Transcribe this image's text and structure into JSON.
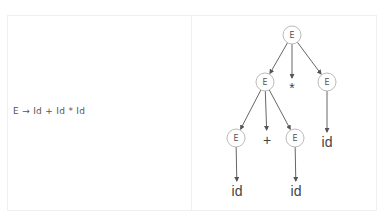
{
  "production": {
    "text": "E → Id + Id * Id"
  },
  "tree": {
    "nodes": [
      {
        "id": "root",
        "label": "E",
        "type": "nonterminal",
        "x": 292,
        "y": 35
      },
      {
        "id": "e-left",
        "label": "E",
        "type": "nonterminal",
        "x": 265,
        "y": 82
      },
      {
        "id": "star",
        "label": "*",
        "type": "terminal",
        "x": 292,
        "y": 88
      },
      {
        "id": "e-right",
        "label": "E",
        "type": "nonterminal",
        "x": 327,
        "y": 82
      },
      {
        "id": "e-ll",
        "label": "E",
        "type": "nonterminal",
        "x": 236,
        "y": 138
      },
      {
        "id": "plus",
        "label": "+",
        "type": "terminal",
        "x": 267,
        "y": 140
      },
      {
        "id": "e-lr",
        "label": "E",
        "type": "nonterminal",
        "x": 295,
        "y": 138
      },
      {
        "id": "id-r",
        "label": "id",
        "type": "terminal",
        "x": 327,
        "y": 142
      },
      {
        "id": "id-ll",
        "label": "id",
        "type": "terminal",
        "x": 237,
        "y": 191
      },
      {
        "id": "id-lr",
        "label": "id",
        "type": "terminal",
        "x": 296,
        "y": 191
      }
    ],
    "edges": [
      [
        "root",
        "e-left"
      ],
      [
        "root",
        "star"
      ],
      [
        "root",
        "e-right"
      ],
      [
        "e-left",
        "e-ll"
      ],
      [
        "e-left",
        "plus"
      ],
      [
        "e-left",
        "e-lr"
      ],
      [
        "e-right",
        "id-r"
      ],
      [
        "e-ll",
        "id-ll"
      ],
      [
        "e-lr",
        "id-lr"
      ]
    ]
  }
}
